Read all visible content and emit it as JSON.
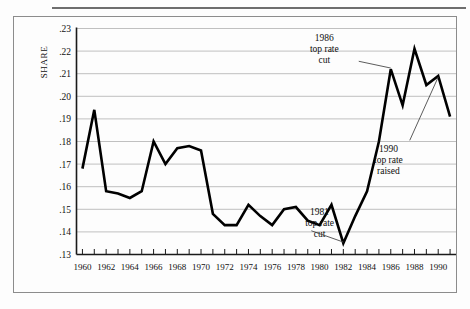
{
  "figure": {
    "axis_title": "SHARE",
    "has_top_rule": true,
    "has_outer_frame": true
  },
  "chart_data": {
    "type": "line",
    "title": "",
    "subtitle": "",
    "xlabel": "",
    "ylabel": "SHARE",
    "xlim": [
      1959.5,
      1991.5
    ],
    "ylim": [
      0.13,
      0.23
    ],
    "grid": true,
    "legend": "none",
    "y_ticks": [
      0.13,
      0.14,
      0.15,
      0.16,
      0.17,
      0.18,
      0.19,
      0.2,
      0.21,
      0.22,
      0.23
    ],
    "y_tick_labels": [
      ".13",
      ".14",
      ".15",
      ".16",
      ".17",
      ".18",
      ".19",
      ".20",
      ".21",
      ".22",
      ".23"
    ],
    "x_ticks": [
      1960,
      1961,
      1962,
      1963,
      1964,
      1965,
      1966,
      1967,
      1968,
      1969,
      1970,
      1971,
      1972,
      1973,
      1974,
      1975,
      1976,
      1977,
      1978,
      1979,
      1980,
      1981,
      1982,
      1983,
      1984,
      1985,
      1986,
      1987,
      1988,
      1989,
      1990,
      1991
    ],
    "x_tick_labels": [
      "1960",
      "1962",
      "1964",
      "1966",
      "1968",
      "1970",
      "1972",
      "1974",
      "1976",
      "1978",
      "1980",
      "1982",
      "1984",
      "1986",
      "1988",
      "1990"
    ],
    "x_tick_label_values": [
      1960,
      1962,
      1964,
      1966,
      1968,
      1970,
      1972,
      1974,
      1976,
      1978,
      1980,
      1982,
      1984,
      1986,
      1988,
      1990
    ],
    "series": [
      {
        "name": "Share",
        "color": "#000000",
        "x": [
          1960,
          1961,
          1962,
          1963,
          1964,
          1965,
          1966,
          1967,
          1968,
          1969,
          1970,
          1971,
          1972,
          1973,
          1974,
          1975,
          1976,
          1977,
          1978,
          1979,
          1980,
          1981,
          1982,
          1983,
          1984,
          1985,
          1986,
          1987,
          1988,
          1989,
          1990,
          1991
        ],
        "values": [
          0.168,
          0.194,
          0.158,
          0.157,
          0.155,
          0.158,
          0.18,
          0.17,
          0.177,
          0.178,
          0.176,
          0.148,
          0.143,
          0.143,
          0.152,
          0.147,
          0.143,
          0.15,
          0.151,
          0.145,
          0.143,
          0.152,
          0.135,
          0.147,
          0.158,
          0.18,
          0.212,
          0.196,
          0.221,
          0.205,
          0.209,
          0.191
        ]
      }
    ],
    "annotations": [
      {
        "id": "annot-1986",
        "lines": [
          "1986",
          "top rate",
          "cut"
        ],
        "text_x": 1980.4,
        "text_y": 0.2245,
        "point_x": 1986.0,
        "point_y": 0.2125,
        "leader_from_x": 1983.3,
        "leader_from_y": 0.2155
      },
      {
        "id": "annot-1990",
        "lines": [
          "1990",
          "top rate",
          "raised"
        ],
        "text_x": 1985.8,
        "text_y": 0.1755,
        "point_x": 1990.0,
        "point_y": 0.2085,
        "leader_from_x": 1987.6,
        "leader_from_y": 0.1805
      },
      {
        "id": "annot-1981",
        "lines": [
          "1981",
          "top rate",
          "cut"
        ],
        "text_x": 1980.0,
        "text_y": 0.1475,
        "point_x": 1982.0,
        "point_y": 0.1355,
        "leader_from_x": 1979.3,
        "leader_from_y": 0.1405
      }
    ]
  }
}
